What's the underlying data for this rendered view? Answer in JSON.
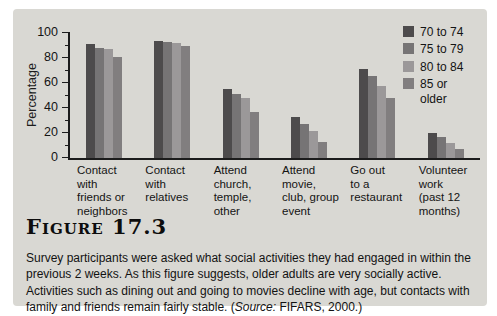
{
  "figure": {
    "label": "Figure 17.3"
  },
  "caption": {
    "text": "Survey participants were asked what social activities they had engaged in within the previous 2 weeks. As this figure suggests, older adults are very socially active. Activities such as dining out and going to movies decline with age, but contacts with family and friends remain fairly stable. ",
    "source_open": "(",
    "source_label": "Source:",
    "source_rest": " FIFARS, 2000.)"
  },
  "chart_data": {
    "type": "bar",
    "title": "",
    "xlabel": "",
    "ylabel": "Percentage",
    "ylim": [
      0,
      100
    ],
    "yticks": [
      0,
      20,
      40,
      60,
      80,
      100
    ],
    "minor_tick_step": 10,
    "grid": false,
    "legend_position": "top-right",
    "categories": [
      "Contact with friends or neighbors",
      "Contact with relatives",
      "Attend church, temple, other",
      "Attend movie, club, group event",
      "Go out to a restaurant",
      "Volunteer work (past 12 months)"
    ],
    "categories_wrapped": [
      "Contact\nwith\nfriends or\nneighbors",
      "Contact\nwith\nrelatives",
      "Attend\nchurch,\ntemple,\nother",
      "Attend\nmovie,\nclub, group\nevent",
      "Go out\nto a\nrestaurant",
      "Volunteer\nwork\n(past 12\nmonths)"
    ],
    "series": [
      {
        "name": "70 to 74",
        "color": "#4d4b4c",
        "values": [
          91,
          94,
          55,
          33,
          71,
          20
        ]
      },
      {
        "name": "75 to 79",
        "color": "#767475",
        "values": [
          88,
          93,
          51,
          27,
          66,
          17
        ]
      },
      {
        "name": "80 to 84",
        "color": "#9b9899",
        "values": [
          87,
          92,
          48,
          22,
          58,
          12
        ]
      },
      {
        "name": "85 or older",
        "color": "#817e7f",
        "values": [
          81,
          90,
          37,
          13,
          48,
          7
        ]
      }
    ]
  }
}
